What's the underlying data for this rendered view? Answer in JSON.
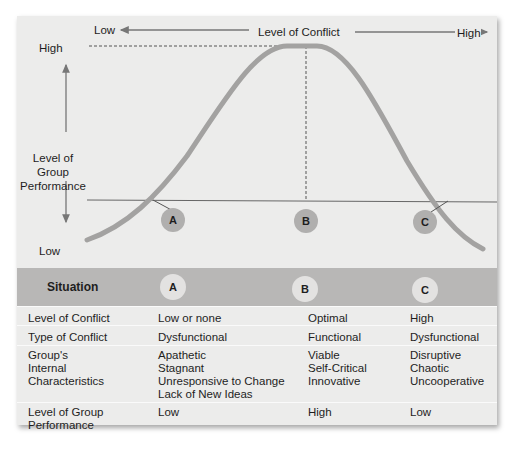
{
  "diagram": {
    "x_axis": {
      "title": "Level of Conflict",
      "low_label": "Low",
      "high_label": "High"
    },
    "y_axis": {
      "title_lines": [
        "Level of",
        "Group",
        "Performance"
      ],
      "high_label": "High",
      "low_label": "Low"
    },
    "markers": [
      "A",
      "B",
      "C"
    ],
    "colors": {
      "panel": "#ececeb",
      "curve": "#a3a2a1",
      "band": "#b8b7b6",
      "marker": "#b0afae",
      "marker_table": "#e3e2e1"
    }
  },
  "table": {
    "header": {
      "label": "Situation",
      "cols": [
        "A",
        "B",
        "C"
      ]
    },
    "rows": [
      {
        "label": [
          "Level of Conflict"
        ],
        "cells": [
          [
            "Low or none"
          ],
          [
            "Optimal"
          ],
          [
            "High"
          ]
        ]
      },
      {
        "label": [
          "Type of Conflict"
        ],
        "cells": [
          [
            "Dysfunctional"
          ],
          [
            "Functional"
          ],
          [
            "Dysfunctional"
          ]
        ]
      },
      {
        "label": [
          "Group's",
          "Internal",
          "Characteristics"
        ],
        "cells": [
          [
            "Apathetic",
            "Stagnant",
            "Unresponsive to Change",
            "Lack of New Ideas"
          ],
          [
            "Viable",
            "Self-Critical",
            "Innovative"
          ],
          [
            "Disruptive",
            "Chaotic",
            "Uncooperative"
          ]
        ]
      },
      {
        "label": [
          "Level of Group",
          "Performance"
        ],
        "cells": [
          [
            "Low"
          ],
          [
            "High"
          ],
          [
            "Low"
          ]
        ]
      }
    ]
  }
}
